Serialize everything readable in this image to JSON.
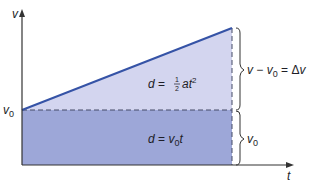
{
  "diagram": {
    "axes": {
      "y_label": "v",
      "x_label": "t",
      "v0_label": "v",
      "v0_sub": "0"
    },
    "regions": {
      "triangle_formula": {
        "lhs": "d",
        "eq": " = ",
        "frac_num": "1",
        "frac_den": "2",
        "body": "at",
        "sup": "2"
      },
      "rectangle_formula": {
        "lhs": "d",
        "eq": " = ",
        "v": "v",
        "sub": "0",
        "t": "t"
      }
    },
    "braces": {
      "upper": {
        "v": "v",
        "minus": " − ",
        "v0": "v",
        "sub": "0",
        "eq": " = Δ",
        "dv": "v"
      },
      "lower": {
        "v": "v",
        "sub": "0"
      }
    },
    "colors": {
      "triangle_fill": "#d3d5ef",
      "rectangle_fill": "#9da7d8",
      "line": "#3553a6",
      "axis": "#333333",
      "dash": "#444a66"
    }
  }
}
